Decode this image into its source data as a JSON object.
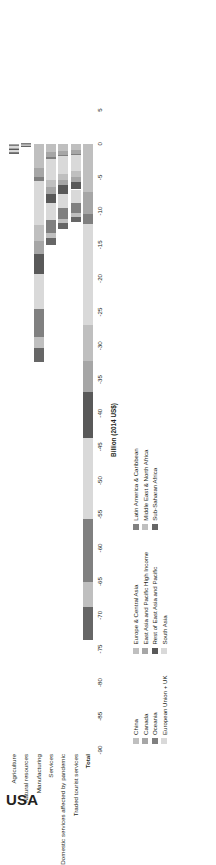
{
  "country": "USA",
  "chart_data": {
    "type": "bar",
    "orientation": "horizontal-stacked",
    "title": "USA",
    "xlabel": "Billion (2014 US$)",
    "ylabel": "",
    "xlim": [
      -90,
      5
    ],
    "xticks": [
      5,
      0,
      -5,
      -10,
      -15,
      -20,
      -25,
      -30,
      -35,
      -40,
      -45,
      -50,
      -55,
      -60,
      -65,
      -70,
      -75,
      -80,
      -85,
      -90
    ],
    "xtick_labels": [
      "5",
      "0",
      "-5",
      "-10",
      "-15",
      "-20",
      "-25",
      "-30",
      "-35",
      "-40",
      "-45",
      "-50",
      "-55",
      "-60",
      "-65",
      "-70",
      "-75",
      "-80",
      "-85",
      "-90"
    ],
    "grid": false,
    "legend_position": "below",
    "categories": [
      "Agriculture",
      "Natural resources",
      "Manufacturing",
      "Services",
      "Domestic services affected by pandemic",
      "Traded tourist services",
      "Total"
    ],
    "series": [
      {
        "name": "China",
        "color": "#bfbfbf",
        "values": [
          -0.15,
          -0.05,
          -3.6,
          -1.3,
          -1.1,
          -1.0,
          -7.2
        ]
      },
      {
        "name": "Canada",
        "color": "#a6a6a6",
        "values": [
          -0.1,
          -0.04,
          -1.4,
          -0.7,
          -0.55,
          -0.5,
          -3.3
        ]
      },
      {
        "name": "Oceania",
        "color": "#7f7f7f",
        "values": [
          -0.05,
          -0.02,
          -0.6,
          -0.3,
          -0.25,
          -0.2,
          -1.4
        ]
      },
      {
        "name": "European Union + UK",
        "color": "#d9d9d9",
        "values": [
          -0.3,
          -0.08,
          -6.5,
          -3.1,
          -2.6,
          -2.4,
          -15.0
        ]
      },
      {
        "name": "Europe & Central Asia",
        "color": "#bfbfbf",
        "values": [
          -0.12,
          -0.03,
          -2.3,
          -1.1,
          -0.9,
          -0.85,
          -5.3
        ]
      },
      {
        "name": "East Asia and Pacific High Income",
        "color": "#a6a6a6",
        "values": [
          -0.1,
          -0.03,
          -2.0,
          -0.95,
          -0.8,
          -0.75,
          -4.6
        ]
      },
      {
        "name": "Rest of East Asia and Pacific",
        "color": "#595959",
        "values": [
          -0.18,
          -0.04,
          -3.0,
          -1.4,
          -1.2,
          -1.1,
          -6.9
        ]
      },
      {
        "name": "South Asia",
        "color": "#d9d9d9",
        "values": [
          -0.22,
          -0.05,
          -5.2,
          -2.5,
          -2.1,
          -1.95,
          -12.0
        ]
      },
      {
        "name": "Latin America & Caribbean",
        "color": "#808080",
        "values": [
          -0.2,
          -0.05,
          -4.1,
          -1.95,
          -1.65,
          -1.5,
          -9.4
        ]
      },
      {
        "name": "Middle East & North Africa",
        "color": "#bfbfbf",
        "values": [
          -0.08,
          -0.02,
          -1.6,
          -0.75,
          -0.65,
          -0.6,
          -3.7
        ]
      },
      {
        "name": "Sub-Saharan Africa",
        "color": "#666666",
        "values": [
          -0.1,
          -0.02,
          -2.1,
          -1.0,
          -0.85,
          -0.78,
          -4.85
        ]
      }
    ],
    "totals": [
      -1.6,
      -0.43,
      -32.4,
      -15.05,
      -12.65,
      -11.63,
      -73.65
    ]
  },
  "legend": {
    "columns": [
      {
        "items": [
          {
            "label": "China",
            "color": "#bfbfbf"
          },
          {
            "label": "Canada",
            "color": "#a6a6a6"
          },
          {
            "label": "Oceania",
            "color": "#7f7f7f"
          },
          {
            "label": "European Union + UK",
            "color": "#d9d9d9"
          }
        ]
      },
      {
        "items": [
          {
            "label": "Europe & Central Asia",
            "color": "#bfbfbf"
          },
          {
            "label": "East Asia and Pacific High Income",
            "color": "#a6a6a6"
          },
          {
            "label": "Rest of East Asia and Pacific",
            "color": "#595959"
          },
          {
            "label": "South Asia",
            "color": "#d9d9d9"
          }
        ]
      },
      {
        "items": [
          {
            "label": "Latin America & Caribbean",
            "color": "#808080"
          },
          {
            "label": "Middle East & North Africa",
            "color": "#bfbfbf"
          },
          {
            "label": "Sub-Saharan Africa",
            "color": "#666666"
          }
        ]
      }
    ]
  }
}
